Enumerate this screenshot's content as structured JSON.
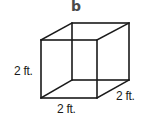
{
  "figure": {
    "panel_label": "b",
    "shape": "cube",
    "line_color": "#1a1a1a",
    "label_color": "#4a4a4a",
    "dimensions": {
      "height": "2 ft.",
      "width": "2 ft.",
      "depth": "2 ft."
    }
  }
}
